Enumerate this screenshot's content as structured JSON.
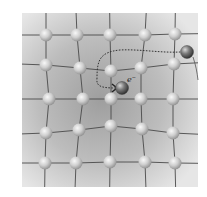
{
  "diagram": {
    "panel": {
      "x": 22,
      "y": 13,
      "w": 176,
      "h": 174
    },
    "colors": {
      "panel_light": "#e6e6e6",
      "panel_dark": "#9e9e9e",
      "bond": "#4a4a4a",
      "atom_light": "#f4f4f4",
      "atom_mid": "#c8c8c8",
      "atom_dark": "#8c8c8c",
      "electron_light": "#d0d0d0",
      "electron_dark": "#3a3a3a",
      "path": "#333333"
    },
    "atom_radius": 6.5,
    "lattice_rows": [
      [
        [
          46,
          35
        ],
        [
          77,
          35
        ],
        [
          110,
          35
        ],
        [
          145,
          35
        ],
        [
          175,
          34
        ]
      ],
      [
        [
          46,
          65
        ],
        [
          80,
          68
        ],
        [
          111,
          71
        ],
        [
          141,
          68
        ],
        [
          174,
          64
        ]
      ],
      [
        [
          49,
          99
        ],
        [
          83,
          99
        ],
        [
          111,
          99
        ],
        [
          141,
          99
        ],
        [
          173,
          99
        ]
      ],
      [
        [
          46,
          133
        ],
        [
          79,
          130
        ],
        [
          111,
          126
        ],
        [
          142,
          129
        ],
        [
          173,
          133
        ]
      ],
      [
        [
          45,
          163
        ],
        [
          76,
          163
        ],
        [
          110,
          162
        ],
        [
          145,
          162
        ],
        [
          175,
          163
        ]
      ]
    ],
    "electron": {
      "x": 122,
      "y": 88,
      "r": 6.5,
      "label": "e",
      "superscript": "−",
      "label_x": 127,
      "label_y": 82
    },
    "second_charge": {
      "x": 187,
      "y": 52,
      "r": 6.5
    },
    "path_label": "electron trajectory"
  }
}
